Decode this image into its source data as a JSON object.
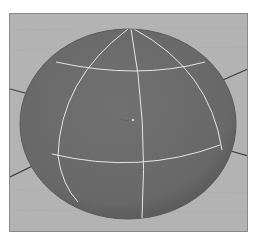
{
  "viewport": {
    "background_color": "#b3b3b3",
    "border_color": "#8a8a8a"
  },
  "sphere": {
    "fill_color": "#6c6c6c",
    "edge_color": "#5a5a5a",
    "wire_color": "#e6e6e6",
    "center": [
      128,
      124
    ],
    "radius_x": 108,
    "radius_y": 95
  },
  "grid_lines": {
    "color": "#3c3c3c"
  }
}
